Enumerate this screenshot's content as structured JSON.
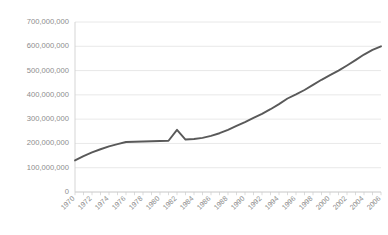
{
  "chart_data": {
    "type": "line",
    "title": "",
    "subtitle": "",
    "xlabel": "",
    "ylabel": "",
    "legend": [],
    "legend_position": "none",
    "grid": "horizontal",
    "background_color": "#ffffff",
    "series_color": "#595959",
    "gridline_color": "#e2e2e2",
    "axis_color": "#d0d0d0",
    "tick_label_color": "#8c8c8c",
    "ylim": [
      0,
      700000000
    ],
    "ytick_values": [
      0,
      100000000,
      200000000,
      300000000,
      400000000,
      500000000,
      600000000,
      700000000
    ],
    "ytick_labels": [
      "0",
      "100,000,000",
      "200,000,000",
      "300,000,000",
      "400,000,000",
      "500,000,000",
      "600,000,000",
      "700,000,000"
    ],
    "xlim": [
      1970,
      2006
    ],
    "xtick_labels": [
      "1970",
      "1972",
      "1974",
      "1976",
      "1978",
      "1980",
      "1982",
      "1984",
      "1986",
      "1988",
      "1990",
      "1992",
      "1994",
      "1996",
      "1998",
      "2000",
      "2002",
      "2004",
      "2006"
    ],
    "xtick_label_rotation": -45,
    "xtick_label_interval_years": 2,
    "minor_tick_interval_years": 1,
    "x": [
      1970,
      1971,
      1972,
      1973,
      1974,
      1975,
      1976,
      1977,
      1978,
      1979,
      1980,
      1981,
      1982,
      1983,
      1984,
      1985,
      1986,
      1987,
      1988,
      1989,
      1990,
      1991,
      1992,
      1993,
      1994,
      1995,
      1996,
      1997,
      1998,
      1999,
      2000,
      2001,
      2002,
      2003,
      2004,
      2005,
      2006
    ],
    "series": [
      {
        "name": "",
        "values": [
          130000000,
          148000000,
          163000000,
          176000000,
          188000000,
          197000000,
          206000000,
          207000000,
          208000000,
          209000000,
          210000000,
          211000000,
          256000000,
          216000000,
          218000000,
          223000000,
          231000000,
          242000000,
          256000000,
          272000000,
          288000000,
          305000000,
          322000000,
          341000000,
          362000000,
          385000000,
          402000000,
          420000000,
          441000000,
          462000000,
          481000000,
          500000000,
          521000000,
          543000000,
          566000000,
          585000000,
          600000000
        ]
      }
    ],
    "annotations": [
      {
        "label": "spike",
        "x": 1982,
        "y": 256000000
      }
    ]
  },
  "plot_geometry": {
    "left": 75,
    "right": 381,
    "top": 22,
    "bottom": 192
  }
}
